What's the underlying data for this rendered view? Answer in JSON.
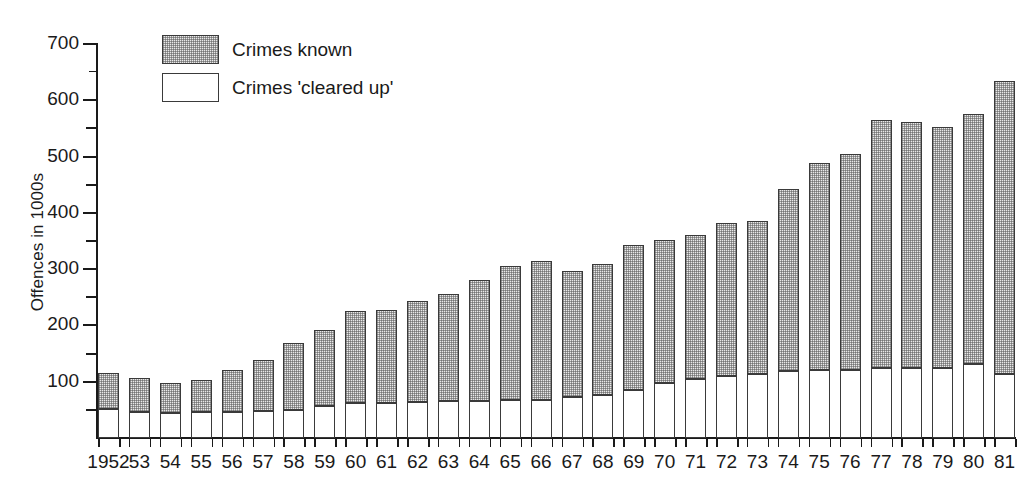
{
  "chart_data": {
    "type": "bar",
    "subtype": "stacked-bar",
    "title": "",
    "xlabel": "",
    "ylabel": "Offences in 1000s",
    "ylim": [
      0,
      700
    ],
    "y_ticks_major": [
      0,
      100,
      200,
      300,
      400,
      500,
      600,
      700
    ],
    "y_ticks_minor": [
      50,
      150,
      250,
      350,
      450,
      550,
      650
    ],
    "grid": false,
    "legend_position": "top-left",
    "categories": [
      "1952",
      "53",
      "54",
      "55",
      "56",
      "57",
      "58",
      "59",
      "60",
      "61",
      "62",
      "63",
      "64",
      "65",
      "66",
      "67",
      "68",
      "69",
      "70",
      "71",
      "72",
      "73",
      "74",
      "75",
      "76",
      "77",
      "78",
      "79",
      "80",
      "81"
    ],
    "series": [
      {
        "name": "Crimes known",
        "values": [
          115,
          107,
          98,
          103,
          120,
          138,
          168,
          192,
          226,
          228,
          243,
          255,
          280,
          305,
          314,
          297,
          309,
          343,
          351,
          360,
          382,
          386,
          442,
          489,
          504,
          565,
          562,
          553,
          576,
          634
        ]
      },
      {
        "name": "Crimes 'cleared up'",
        "values": [
          52,
          47,
          45,
          46,
          47,
          48,
          50,
          57,
          62,
          63,
          64,
          65,
          66,
          67,
          68,
          72,
          77,
          86,
          97,
          105,
          110,
          113,
          119,
          120,
          120,
          124,
          124,
          125,
          131,
          114
        ]
      }
    ]
  },
  "legend": {
    "items": [
      {
        "label": "Crimes known",
        "swatch": "stippled-gray"
      },
      {
        "label": "Crimes 'cleared up'",
        "swatch": "white"
      }
    ]
  },
  "colors": {
    "axis": "#1a1a1a",
    "bar_outline": "#3a3a3a",
    "known_fill": "#e9e9e9",
    "cleared_fill": "#ffffff",
    "background": "#ffffff"
  }
}
